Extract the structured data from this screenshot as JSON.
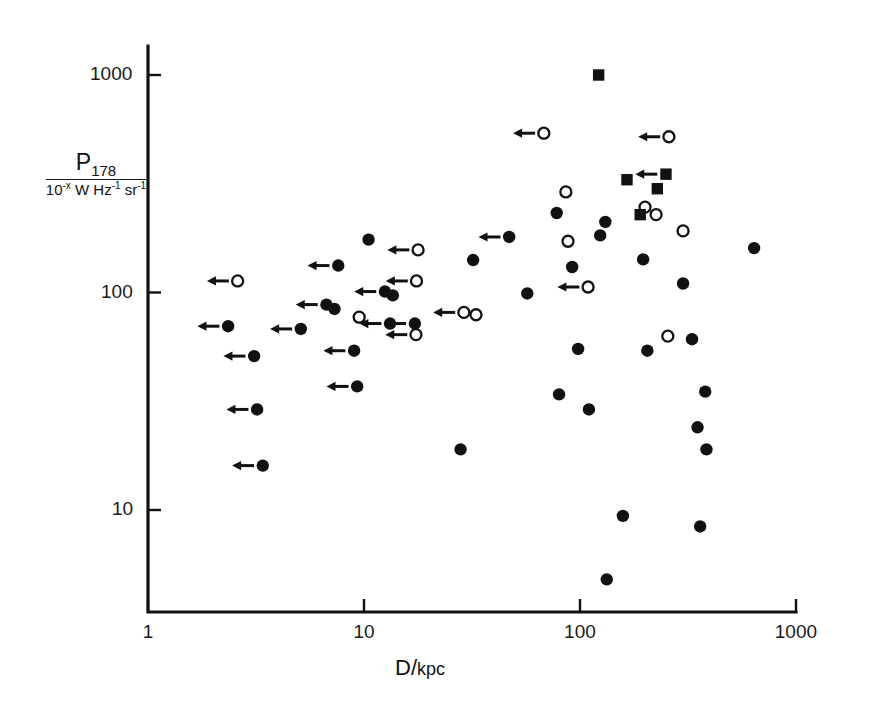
{
  "figure": {
    "background": "#ffffff",
    "ink_color": "#111111"
  },
  "axes": {
    "x_title_main": "D",
    "x_title_sep": "/",
    "x_title_unit": "kpc",
    "y_title_symbol": "P",
    "y_title_subscript": "178",
    "y_title_denominator_prefix": "10",
    "y_title_denominator_exponent": "-x",
    "y_title_denominator_units": "W Hz",
    "y_title_units_exp1": "-1",
    "y_title_units_2": "sr",
    "y_title_units_exp2": "-1",
    "x_ticks": [
      "1",
      "10",
      "100",
      "1000"
    ],
    "y_ticks": [
      "10",
      "100",
      "1000"
    ],
    "x_range": [
      1,
      1000
    ],
    "y_range": [
      3.3,
      2200
    ],
    "x_scale": "log",
    "y_scale": "log",
    "grid": "off",
    "frame": "left-and-bottom-spines"
  },
  "chart_data": {
    "type": "scatter",
    "title": "",
    "xlabel": "D / kpc",
    "ylabel": "P_178 / 10^-x W Hz^-1 sr^-1",
    "xscale": "log",
    "yscale": "log",
    "xlim": [
      1,
      1000
    ],
    "ylim": [
      3.3,
      2200
    ],
    "grid": false,
    "legend": "none",
    "marker_types": {
      "filled-circle": "filled circle",
      "open-circle": "open circle",
      "filled-square": "filled square"
    },
    "arrow_meaning": "leftward arrow denotes upper limit on D",
    "series": [
      {
        "name": "filled-circle",
        "marker": "filled-circle",
        "points": [
          {
            "x": 2.35,
            "y": 70,
            "arrow": true
          },
          {
            "x": 3.1,
            "y": 51,
            "arrow": true
          },
          {
            "x": 3.2,
            "y": 29,
            "arrow": true
          },
          {
            "x": 3.4,
            "y": 16,
            "arrow": true
          },
          {
            "x": 5.1,
            "y": 68,
            "arrow": true
          },
          {
            "x": 6.7,
            "y": 88,
            "arrow": true
          },
          {
            "x": 7.3,
            "y": 84,
            "arrow": false
          },
          {
            "x": 7.6,
            "y": 133,
            "arrow": true
          },
          {
            "x": 9.0,
            "y": 54,
            "arrow": true
          },
          {
            "x": 9.3,
            "y": 37,
            "arrow": true
          },
          {
            "x": 10.5,
            "y": 175,
            "arrow": false
          },
          {
            "x": 12.5,
            "y": 101,
            "arrow": true
          },
          {
            "x": 13.6,
            "y": 97,
            "arrow": false
          },
          {
            "x": 13.2,
            "y": 72,
            "arrow": true
          },
          {
            "x": 17.2,
            "y": 72,
            "arrow": true
          },
          {
            "x": 28,
            "y": 19,
            "arrow": false
          },
          {
            "x": 32,
            "y": 141,
            "arrow": false
          },
          {
            "x": 47,
            "y": 180,
            "arrow": true
          },
          {
            "x": 57,
            "y": 99,
            "arrow": false
          },
          {
            "x": 78,
            "y": 232,
            "arrow": false
          },
          {
            "x": 80,
            "y": 34,
            "arrow": false
          },
          {
            "x": 92,
            "y": 131,
            "arrow": false
          },
          {
            "x": 98,
            "y": 55,
            "arrow": false
          },
          {
            "x": 110,
            "y": 29,
            "arrow": false
          },
          {
            "x": 124,
            "y": 183,
            "arrow": false
          },
          {
            "x": 131,
            "y": 211,
            "arrow": false
          },
          {
            "x": 133,
            "y": 4.8,
            "arrow": false
          },
          {
            "x": 158,
            "y": 9.4,
            "arrow": false
          },
          {
            "x": 196,
            "y": 142,
            "arrow": false
          },
          {
            "x": 205,
            "y": 54,
            "arrow": false
          },
          {
            "x": 300,
            "y": 110,
            "arrow": false
          },
          {
            "x": 330,
            "y": 61,
            "arrow": false
          },
          {
            "x": 350,
            "y": 24,
            "arrow": false
          },
          {
            "x": 360,
            "y": 8.4,
            "arrow": false
          },
          {
            "x": 380,
            "y": 35,
            "arrow": false
          },
          {
            "x": 385,
            "y": 19,
            "arrow": false
          },
          {
            "x": 640,
            "y": 160,
            "arrow": false
          }
        ]
      },
      {
        "name": "open-circle",
        "marker": "open-circle",
        "points": [
          {
            "x": 2.6,
            "y": 113,
            "arrow": true
          },
          {
            "x": 9.5,
            "y": 77,
            "arrow": false
          },
          {
            "x": 17.5,
            "y": 113,
            "arrow": true
          },
          {
            "x": 17.4,
            "y": 64,
            "arrow": true
          },
          {
            "x": 17.8,
            "y": 157,
            "arrow": true
          },
          {
            "x": 29,
            "y": 81,
            "arrow": true
          },
          {
            "x": 33,
            "y": 79,
            "arrow": false
          },
          {
            "x": 68,
            "y": 540,
            "arrow": true
          },
          {
            "x": 86,
            "y": 290,
            "arrow": false
          },
          {
            "x": 88,
            "y": 172,
            "arrow": false
          },
          {
            "x": 109,
            "y": 106,
            "arrow": true
          },
          {
            "x": 200,
            "y": 247,
            "arrow": false
          },
          {
            "x": 225,
            "y": 228,
            "arrow": false
          },
          {
            "x": 258,
            "y": 520,
            "arrow": true
          },
          {
            "x": 255,
            "y": 63,
            "arrow": false
          },
          {
            "x": 300,
            "y": 192,
            "arrow": false
          }
        ]
      },
      {
        "name": "filled-square",
        "marker": "filled-square",
        "points": [
          {
            "x": 122,
            "y": 1000,
            "arrow": false
          },
          {
            "x": 165,
            "y": 330,
            "arrow": false
          },
          {
            "x": 190,
            "y": 228,
            "arrow": false
          },
          {
            "x": 228,
            "y": 300,
            "arrow": false
          },
          {
            "x": 250,
            "y": 350,
            "arrow": true
          }
        ]
      }
    ]
  }
}
